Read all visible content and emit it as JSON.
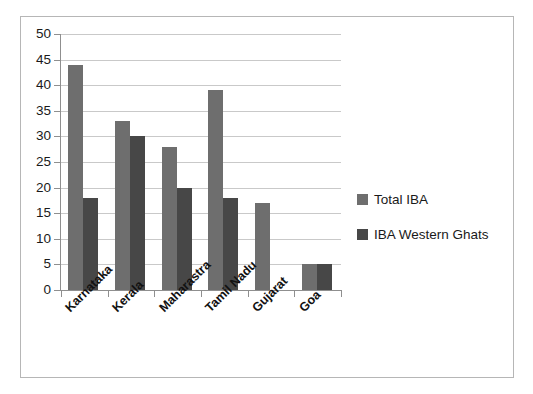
{
  "chart_data": {
    "type": "bar",
    "title": "",
    "subtitle": "",
    "xlabel": "",
    "ylabel": "",
    "ylim": [
      0,
      50
    ],
    "ytick_step": 5,
    "yticks": [
      "0",
      "5",
      "10",
      "15",
      "20",
      "25",
      "30",
      "35",
      "40",
      "45",
      "50"
    ],
    "grid": true,
    "grid_axis": "y",
    "legend_position": "right",
    "categories": [
      "Karnataka",
      "Kerala",
      "Maharastra",
      "Tamil Nadu",
      "Gujarat",
      "Goa"
    ],
    "series": [
      {
        "name": "Total IBA",
        "color": "#6e6e6e",
        "values": [
          44,
          33,
          28,
          39,
          17,
          5
        ]
      },
      {
        "name": "IBA Western Ghats",
        "color": "#474747",
        "values": [
          18,
          30,
          20,
          18,
          0,
          5
        ]
      }
    ]
  },
  "legend": {
    "items": [
      {
        "label": "Total IBA",
        "color": "#6e6e6e"
      },
      {
        "label": "IBA Western Ghats",
        "color": "#474747"
      }
    ]
  },
  "colors": {
    "total_iba": "#6e6e6e",
    "iba_western_ghats": "#474747",
    "gridline": "#c9c9c9",
    "axis": "#8f8f8f",
    "frame_border": "#b6b6b6",
    "background": "#ffffff",
    "text": "#1a1a1a"
  }
}
